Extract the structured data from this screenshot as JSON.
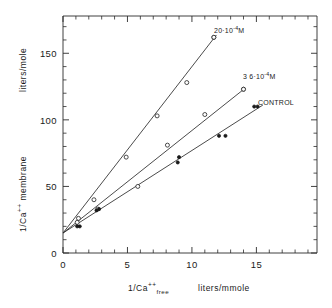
{
  "chart_data": {
    "type": "scatter",
    "title": "",
    "xlabel": "1/Ca++ free    liters/mmole",
    "ylabel": "1/Ca++ membrane    liters/mole",
    "xlim": [
      0,
      19.7
    ],
    "ylim": [
      0,
      178
    ],
    "grid": false,
    "legend_position": "inline-right-of-line-ends",
    "x_ticks": [
      0,
      5,
      10,
      15
    ],
    "x_tick_labels": [
      "0",
      "5",
      "10",
      "15"
    ],
    "x_minor_step": 1,
    "y_ticks": [
      0,
      50,
      100,
      150
    ],
    "y_tick_labels": [
      "0",
      "50",
      "100",
      "150"
    ],
    "y_minor_step": 10,
    "shared_intercept": 15,
    "series": [
      {
        "name": "20x10-4M",
        "label_text": "20·10",
        "label_exponent": "-4",
        "label_suffix": "M",
        "marker": "open-circle",
        "slope": 12.5,
        "intercept": 15,
        "line_x": [
          0,
          11.9
        ],
        "points": [
          {
            "x": 1.2,
            "y": 26
          },
          {
            "x": 2.4,
            "y": 40
          },
          {
            "x": 4.9,
            "y": 72
          },
          {
            "x": 7.3,
            "y": 103
          },
          {
            "x": 9.6,
            "y": 128
          },
          {
            "x": 11.7,
            "y": 162
          }
        ]
      },
      {
        "name": "3.6x10-4M",
        "label_text": "3 6·10",
        "label_exponent": "-4",
        "label_suffix": "M",
        "marker": "open-circle",
        "slope": 7.7,
        "intercept": 15,
        "line_x": [
          0,
          14.1
        ],
        "points": [
          {
            "x": 1.1,
            "y": 23
          },
          {
            "x": 2.7,
            "y": 33
          },
          {
            "x": 5.8,
            "y": 50
          },
          {
            "x": 8.1,
            "y": 81
          },
          {
            "x": 11.0,
            "y": 104
          },
          {
            "x": 14.0,
            "y": 123
          }
        ]
      },
      {
        "name": "CONTROL",
        "label_text": "CONTROL",
        "label_exponent": "",
        "label_suffix": "",
        "marker": "filled-circle",
        "slope": 6.2,
        "intercept": 15,
        "line_x": [
          0,
          15.5
        ],
        "points": [
          {
            "x": 1.1,
            "y": 20
          },
          {
            "x": 1.3,
            "y": 20
          },
          {
            "x": 2.6,
            "y": 32
          },
          {
            "x": 2.8,
            "y": 33
          },
          {
            "x": 8.9,
            "y": 68
          },
          {
            "x": 9.0,
            "y": 72
          },
          {
            "x": 12.1,
            "y": 88
          },
          {
            "x": 12.6,
            "y": 88
          }
        ]
      }
    ],
    "annotations": [
      {
        "name": "label-20e-4M",
        "for_series": "20x10-4M",
        "marker": "open-circle",
        "marker_x": 11.7,
        "marker_y": 162
      },
      {
        "name": "label-36e-4M",
        "for_series": "3.6x10-4M",
        "marker": "open-circle",
        "marker_x": 14.0,
        "marker_y": 123
      },
      {
        "name": "label-control",
        "for_series": "CONTROL",
        "marker": "filled-circle-pair",
        "marker_x": 15.0,
        "marker_y": 110
      }
    ]
  },
  "axes": {
    "y_units_label": "liters/mole",
    "y_main_prefix": "1/Ca",
    "y_main_sup": "++",
    "y_main_suffix": "membrane",
    "x_main_prefix": "1/Ca",
    "x_main_sup": "++",
    "x_main_sub": "free",
    "x_units_label": "liters/mmole"
  },
  "style": {
    "axis_color": "#2b2b2b",
    "line_color": "#2b2b2b",
    "marker_open_fill": "#ffffff",
    "marker_filled_fill": "#1a1a1a",
    "background": "#ffffff"
  }
}
